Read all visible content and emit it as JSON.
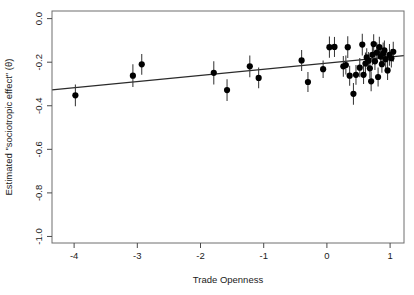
{
  "chart_data": {
    "type": "scatter",
    "title": "",
    "xlabel": "Trade Openness",
    "ylabel": "Estimated \"sociotropic effect\" (θ)",
    "xlim": [
      -4.35,
      1.22
    ],
    "ylim": [
      -1.03,
      0.035
    ],
    "xticks": [
      -4,
      -3,
      -2,
      -1,
      0,
      1
    ],
    "xticklabels": [
      "-4",
      "-3",
      "-2",
      "-1",
      "0",
      "1"
    ],
    "yticks": [
      0.0,
      -0.2,
      -0.4,
      -0.6,
      -0.8,
      -1.0
    ],
    "yticklabels": [
      "0.0",
      "-0.2",
      "-0.4",
      "-0.6",
      "-0.8",
      "-1.0"
    ],
    "grid": false,
    "legend": null,
    "series": [
      {
        "name": "country estimates",
        "marker": "filled-circle",
        "color": "#000000",
        "errorbars": "vertical",
        "points": [
          {
            "x": -3.98,
            "y": -0.352,
            "yerr": 0.05
          },
          {
            "x": -3.07,
            "y": -0.262,
            "yerr": 0.052
          },
          {
            "x": -2.93,
            "y": -0.21,
            "yerr": 0.048
          },
          {
            "x": -1.79,
            "y": -0.249,
            "yerr": 0.053
          },
          {
            "x": -1.58,
            "y": -0.328,
            "yerr": 0.05
          },
          {
            "x": -1.22,
            "y": -0.219,
            "yerr": 0.05
          },
          {
            "x": -1.08,
            "y": -0.272,
            "yerr": 0.048
          },
          {
            "x": -0.4,
            "y": -0.192,
            "yerr": 0.048
          },
          {
            "x": -0.3,
            "y": -0.291,
            "yerr": 0.046
          },
          {
            "x": -0.06,
            "y": -0.232,
            "yerr": 0.04
          },
          {
            "x": 0.04,
            "y": -0.131,
            "yerr": 0.049
          },
          {
            "x": 0.12,
            "y": -0.13,
            "yerr": 0.046
          },
          {
            "x": 0.26,
            "y": -0.219,
            "yerr": 0.048
          },
          {
            "x": 0.3,
            "y": -0.213,
            "yerr": 0.044
          },
          {
            "x": 0.33,
            "y": -0.131,
            "yerr": 0.05
          },
          {
            "x": 0.36,
            "y": -0.262,
            "yerr": 0.046
          },
          {
            "x": 0.42,
            "y": -0.345,
            "yerr": 0.05
          },
          {
            "x": 0.46,
            "y": -0.258,
            "yerr": 0.045
          },
          {
            "x": 0.52,
            "y": -0.225,
            "yerr": 0.044
          },
          {
            "x": 0.56,
            "y": -0.119,
            "yerr": 0.05
          },
          {
            "x": 0.58,
            "y": -0.258,
            "yerr": 0.042
          },
          {
            "x": 0.61,
            "y": -0.206,
            "yerr": 0.05
          },
          {
            "x": 0.63,
            "y": -0.178,
            "yerr": 0.042
          },
          {
            "x": 0.66,
            "y": -0.193,
            "yerr": 0.04
          },
          {
            "x": 0.68,
            "y": -0.228,
            "yerr": 0.046
          },
          {
            "x": 0.7,
            "y": -0.288,
            "yerr": 0.045
          },
          {
            "x": 0.72,
            "y": -0.166,
            "yerr": 0.048
          },
          {
            "x": 0.74,
            "y": -0.117,
            "yerr": 0.045
          },
          {
            "x": 0.76,
            "y": -0.196,
            "yerr": 0.04
          },
          {
            "x": 0.79,
            "y": -0.156,
            "yerr": 0.046
          },
          {
            "x": 0.81,
            "y": -0.268,
            "yerr": 0.044
          },
          {
            "x": 0.83,
            "y": -0.131,
            "yerr": 0.048
          },
          {
            "x": 0.85,
            "y": -0.174,
            "yerr": 0.042
          },
          {
            "x": 0.87,
            "y": -0.209,
            "yerr": 0.04
          },
          {
            "x": 0.89,
            "y": -0.16,
            "yerr": 0.05
          },
          {
            "x": 0.91,
            "y": -0.146,
            "yerr": 0.046
          },
          {
            "x": 0.93,
            "y": -0.186,
            "yerr": 0.042
          },
          {
            "x": 0.96,
            "y": -0.238,
            "yerr": 0.044
          },
          {
            "x": 0.99,
            "y": -0.166,
            "yerr": 0.05
          },
          {
            "x": 1.02,
            "y": -0.182,
            "yerr": 0.042
          },
          {
            "x": 1.05,
            "y": -0.152,
            "yerr": 0.046
          }
        ]
      }
    ],
    "fit_line": {
      "name": "linear fit",
      "color": "#2b2b2b",
      "x0": -4.35,
      "y0": -0.327,
      "x1": 1.22,
      "y1": -0.17
    }
  }
}
